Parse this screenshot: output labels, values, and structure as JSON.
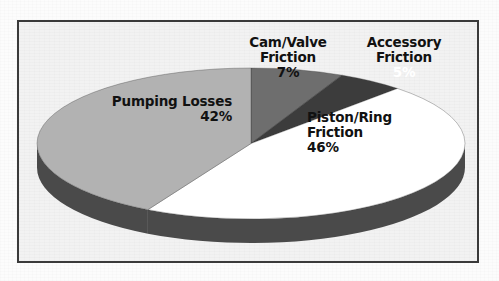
{
  "chart_data": {
    "type": "pie",
    "title": "",
    "subtitle": "",
    "xlabel": "",
    "ylabel": "",
    "legend_position": "none",
    "grid": false,
    "labels_on_slices": true,
    "three_d": true,
    "categories": [
      "Piston/Ring Friction",
      "Pumping Losses",
      "Cam/Valve Friction",
      "Accessory Friction"
    ],
    "values": [
      46,
      42,
      7,
      5
    ],
    "unit": "%",
    "slices": [
      {
        "name": "piston-ring-friction",
        "label_line1": "Piston/Ring",
        "label_line2": "Friction",
        "percent_text": "46%",
        "value": 46,
        "color": "#ffffff",
        "side_color": "#4a4a4a",
        "label_color": "#111111"
      },
      {
        "name": "pumping-losses",
        "label_line1": "Pumping Losses",
        "label_line2": "",
        "percent_text": "42%",
        "value": 42,
        "color": "#b2b2b2",
        "side_color": "#4a4a4a",
        "label_color": "#111111"
      },
      {
        "name": "cam-valve-friction",
        "label_line1": "Cam/Valve",
        "label_line2": "Friction",
        "percent_text": "7%",
        "value": 7,
        "color": "#6e6e6e",
        "side_color": "#4a4a4a",
        "label_color": "#111111"
      },
      {
        "name": "accessory-friction",
        "label_line1": "Accessory",
        "label_line2": "Friction",
        "percent_text": "5%",
        "value": 5,
        "color": "#3c3c3c",
        "side_color": "#4a4a4a",
        "label_color": "#ffffff"
      }
    ]
  },
  "frame": {
    "border_color": "#3a3a3a",
    "background_color": "#f2f2f2"
  },
  "page": {
    "background_color": "#fcfcfc"
  }
}
